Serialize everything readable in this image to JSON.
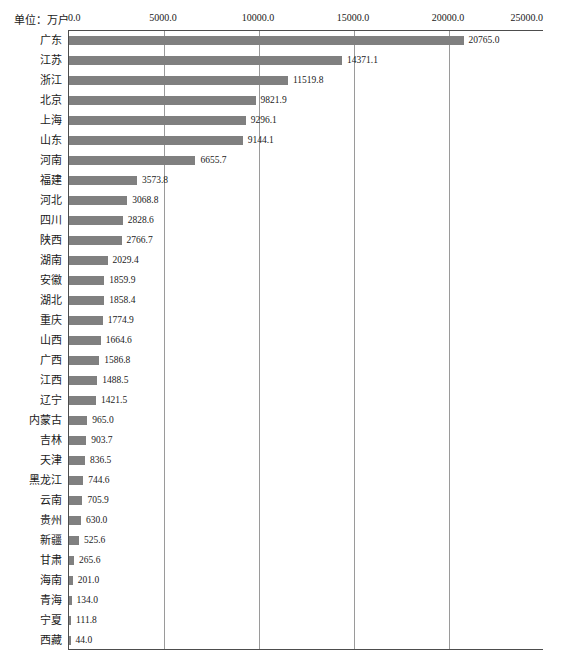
{
  "chart_data": {
    "type": "bar",
    "orientation": "horizontal",
    "title": "",
    "subtitle": "",
    "unit_label": "单位：万户",
    "xlabel": "",
    "ylabel": "",
    "xlim": [
      0,
      25000
    ],
    "grid": true,
    "legend": false,
    "x_ticks": [
      0,
      5000,
      10000,
      15000,
      20000,
      25000
    ],
    "x_tick_labels": [
      "0.0",
      "5000.0",
      "10000.0",
      "15000.0",
      "20000.0",
      "25000.0"
    ],
    "bar_color": "#808080",
    "categories": [
      "广东",
      "江苏",
      "浙江",
      "北京",
      "上海",
      "山东",
      "河南",
      "福建",
      "河北",
      "四川",
      "陕西",
      "湖南",
      "安徽",
      "湖北",
      "重庆",
      "山西",
      "广西",
      "江西",
      "辽宁",
      "内蒙古",
      "吉林",
      "天津",
      "黑龙江",
      "云南",
      "贵州",
      "新疆",
      "甘肃",
      "海南",
      "青海",
      "宁夏",
      "西藏"
    ],
    "values": [
      20765.0,
      14371.1,
      11519.8,
      9821.9,
      9296.1,
      9144.1,
      6655.7,
      3573.8,
      3068.8,
      2828.6,
      2766.7,
      2029.4,
      1859.9,
      1858.4,
      1774.9,
      1664.6,
      1586.8,
      1488.5,
      1421.5,
      965.0,
      903.7,
      836.5,
      744.6,
      705.9,
      630.0,
      525.6,
      265.6,
      201.0,
      134.0,
      111.8,
      44.0
    ],
    "value_labels": [
      "20765.0",
      "14371.1",
      "11519.8",
      "9821.9",
      "9296.1",
      "9144.1",
      "6655.7",
      "3573.8",
      "3068.8",
      "2828.6",
      "2766.7",
      "2029.4",
      "1859.9",
      "1858.4",
      "1774.9",
      "1664.6",
      "1586.8",
      "1488.5",
      "1421.5",
      "965.0",
      "903.7",
      "836.5",
      "744.6",
      "705.9",
      "630.0",
      "525.6",
      "265.6",
      "201.0",
      "134.0",
      "111.8",
      "44.0"
    ]
  }
}
